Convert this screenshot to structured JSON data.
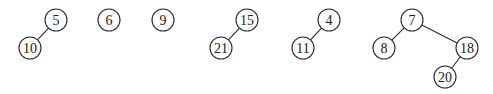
{
  "diagram": {
    "type": "binomial-heap-forest",
    "radius": 11,
    "trees": [
      {
        "root": "5",
        "nodes": [
          {
            "id": "n5",
            "label": "5",
            "x": 56,
            "y": 20
          },
          {
            "id": "n10",
            "label": "10",
            "x": 30,
            "y": 48
          }
        ],
        "edges": [
          [
            "n5",
            "n10"
          ]
        ]
      },
      {
        "root": "6",
        "nodes": [
          {
            "id": "n6",
            "label": "6",
            "x": 109,
            "y": 20
          }
        ],
        "edges": []
      },
      {
        "root": "9",
        "nodes": [
          {
            "id": "n9",
            "label": "9",
            "x": 163,
            "y": 20
          }
        ],
        "edges": []
      },
      {
        "root": "15",
        "nodes": [
          {
            "id": "n15",
            "label": "15",
            "x": 247,
            "y": 20
          },
          {
            "id": "n21",
            "label": "21",
            "x": 221,
            "y": 48
          }
        ],
        "edges": [
          [
            "n15",
            "n21"
          ]
        ]
      },
      {
        "root": "4",
        "nodes": [
          {
            "id": "n4",
            "label": "4",
            "x": 329,
            "y": 20
          },
          {
            "id": "n11",
            "label": "11",
            "x": 303,
            "y": 48
          }
        ],
        "edges": [
          [
            "n4",
            "n11"
          ]
        ]
      },
      {
        "root": "7",
        "nodes": [
          {
            "id": "n7",
            "label": "7",
            "x": 412,
            "y": 20
          },
          {
            "id": "n8",
            "label": "8",
            "x": 384,
            "y": 48
          },
          {
            "id": "n18",
            "label": "18",
            "x": 467,
            "y": 48
          },
          {
            "id": "n20",
            "label": "20",
            "x": 445,
            "y": 77
          }
        ],
        "edges": [
          [
            "n7",
            "n8"
          ],
          [
            "n7",
            "n18"
          ],
          [
            "n18",
            "n20"
          ]
        ]
      }
    ]
  }
}
